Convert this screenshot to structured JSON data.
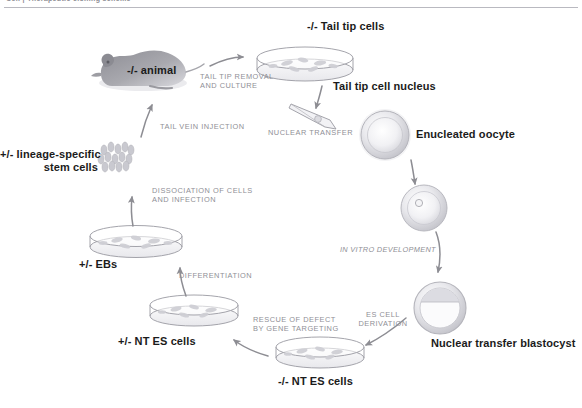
{
  "figure": {
    "running_head": "Cell  |  Therapeutic cloning scheme",
    "type": "cyclical process flow diagram"
  },
  "labels": [
    {
      "id": "animal",
      "text": "-/- animal",
      "style": "bold"
    },
    {
      "id": "tailtipcells",
      "text": "-/- Tail tip cells",
      "style": "bold"
    },
    {
      "id": "nucleus",
      "text": "Tail tip cell nucleus",
      "style": "bold"
    },
    {
      "id": "oocyte",
      "text": "Enucleated oocyte",
      "style": "bold"
    },
    {
      "id": "blastocyst",
      "text": "Nuclear transfer blastocyst",
      "style": "bold"
    },
    {
      "id": "ntes_neg",
      "text": "-/- NT ES cells",
      "style": "bold"
    },
    {
      "id": "ntes_het",
      "text": "+/- NT ES cells",
      "style": "bold"
    },
    {
      "id": "ebs",
      "text": "+/- EBs",
      "style": "bold"
    },
    {
      "id": "stemcells_l1",
      "text": "+/- lineage-specific",
      "style": "bold"
    },
    {
      "id": "stemcells_l2",
      "text": "stem cells",
      "style": "bold"
    }
  ],
  "steps": [
    {
      "id": "tail_removal_l1",
      "text": "TAIL TIP REMOVAL",
      "italic": false
    },
    {
      "id": "tail_removal_l2",
      "text": "AND CULTURE",
      "italic": false
    },
    {
      "id": "nuclear_transfer",
      "text": "NUCLEAR TRANSFER",
      "italic": false
    },
    {
      "id": "in_vitro",
      "text": "IN VITRO DEVELOPMENT",
      "italic": true
    },
    {
      "id": "es_deriv_l1",
      "text": "ES CELL",
      "italic": false
    },
    {
      "id": "es_deriv_l2",
      "text": "DERIVATION",
      "italic": false
    },
    {
      "id": "rescue_l1",
      "text": "RESCUE OF DEFECT",
      "italic": false
    },
    {
      "id": "rescue_l2",
      "text": "BY GENE TARGETING",
      "italic": false
    },
    {
      "id": "differentiation",
      "text": "DIFFERENTIATION",
      "italic": false
    },
    {
      "id": "dissoc_l1",
      "text": "DISSOCIATION OF CELLS",
      "italic": false
    },
    {
      "id": "dissoc_l2",
      "text": "AND INFECTION",
      "italic": false
    },
    {
      "id": "tail_vein",
      "text": "TAIL VEIN INJECTION",
      "italic": false
    }
  ],
  "colors": {
    "background": "#ffffff",
    "label_text": "#1b1b1b",
    "process_text": "#8f8f96",
    "arrow": "#8d8d93",
    "outline": "#9a9aa1",
    "cell_fill": "#d5d5da",
    "mouse_fill": "#9a9aa0",
    "rule": "#b9b9c0"
  },
  "icons": [
    {
      "name": "mouse-icon",
      "depicts": "grey mouse silhouette"
    },
    {
      "name": "petri-dish-tailtip-icon",
      "depicts": "petri dish with cultured tail tip cells"
    },
    {
      "name": "micropipette-icon",
      "depicts": "injection needle holding a nucleus"
    },
    {
      "name": "oocyte-icon",
      "depicts": "enucleated oocyte sphere"
    },
    {
      "name": "reconstructed-oocyte-icon",
      "depicts": "oocyte containing transferred nucleus"
    },
    {
      "name": "blastocyst-icon",
      "depicts": "blastocyst with inner cell mass"
    },
    {
      "name": "petri-dish-ntes-neg-icon",
      "depicts": "petri dish of -/- NT ES cells"
    },
    {
      "name": "petri-dish-ntes-het-icon",
      "depicts": "petri dish of +/- NT ES cells"
    },
    {
      "name": "petri-dish-ebs-icon",
      "depicts": "petri dish of embryoid bodies"
    },
    {
      "name": "stem-cell-cluster-icon",
      "depicts": "cluster of lineage-specific stem cells"
    }
  ]
}
